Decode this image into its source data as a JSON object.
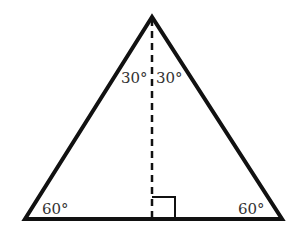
{
  "diagram": {
    "type": "geometry",
    "shape": "equilateral-triangle-with-altitude",
    "colors": {
      "stroke": "#111111",
      "text": "#333333",
      "background": "#ffffff"
    },
    "labels": {
      "apex_left": "30°",
      "apex_right": "30°",
      "base_left": "60°",
      "base_right": "60°"
    },
    "right_angle_marker": true,
    "altitude_style": "dashed"
  }
}
